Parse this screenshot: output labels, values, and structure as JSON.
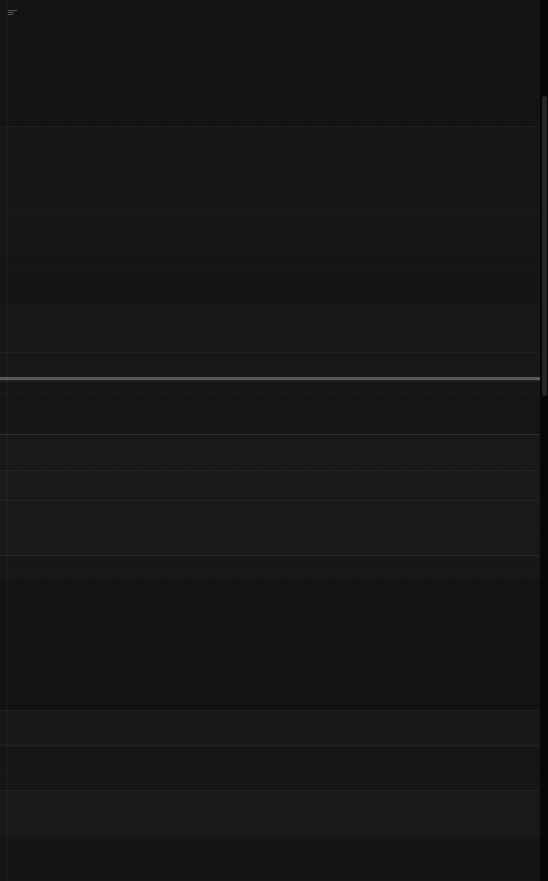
{
  "screen": {
    "width": 548,
    "height": 881,
    "appearance": "dark",
    "background_color": "#151515",
    "note": "Screenshot is near-black with extremely low contrast; no glyph or label text is resolvable at any magnification."
  },
  "palette": {
    "page_background": "#151515",
    "band_darkest": "#0d0d0d",
    "band_dark": "#131313",
    "band_mid": "#181818",
    "band_light": "#1e1e1e",
    "primary_rule": "#5a5a5a",
    "faint_rule": "#2c2c2c",
    "subtle_rule": "#222222",
    "scrollbar_track": "#060606",
    "scrollbar_thumb": "#242424",
    "icon_highlight": "#8d8d8d"
  },
  "layout": {
    "left_margin_x": 7,
    "scrollbar_width": 8,
    "scrollbar_thumb_top": 96,
    "scrollbar_thumb_height": 300
  },
  "bands": [
    {
      "name": "header-band",
      "top": 0,
      "height": 126,
      "color": "#131313"
    },
    {
      "name": "upper-content-band",
      "top": 126,
      "height": 129,
      "color": "#161616"
    },
    {
      "name": "dense-text-band",
      "top": 255,
      "height": 50,
      "color": "#141414"
    },
    {
      "name": "pre-separator-band",
      "top": 305,
      "height": 72,
      "color": "#171717"
    },
    {
      "name": "separator-highlight",
      "top": 377,
      "height": 3,
      "color": "#5a5a5a"
    },
    {
      "name": "list-band-a",
      "top": 380,
      "height": 54,
      "color": "#151515"
    },
    {
      "name": "list-band-b",
      "top": 434,
      "height": 36,
      "color": "#181818"
    },
    {
      "name": "list-band-c",
      "top": 470,
      "height": 30,
      "color": "#1a1a1a"
    },
    {
      "name": "list-band-d",
      "top": 500,
      "height": 55,
      "color": "#181818"
    },
    {
      "name": "list-band-e",
      "top": 555,
      "height": 25,
      "color": "#161616"
    },
    {
      "name": "open-band",
      "top": 580,
      "height": 130,
      "color": "#121212"
    },
    {
      "name": "list-band-f",
      "top": 710,
      "height": 35,
      "color": "#171717"
    },
    {
      "name": "list-band-g",
      "top": 745,
      "height": 45,
      "color": "#151515"
    },
    {
      "name": "list-band-h",
      "top": 790,
      "height": 45,
      "color": "#181818"
    },
    {
      "name": "footer-band",
      "top": 835,
      "height": 46,
      "color": "#141414"
    }
  ],
  "rules": [
    {
      "name": "header-divider",
      "top": 126,
      "left": 0,
      "width": 548,
      "color": "#242424",
      "opacity": 0.55
    },
    {
      "name": "row-divider-1",
      "top": 214,
      "left": 0,
      "width": 548,
      "color": "#222222",
      "opacity": 0.4
    },
    {
      "name": "row-divider-2",
      "top": 268,
      "left": 0,
      "width": 548,
      "color": "#202020",
      "opacity": 0.35
    },
    {
      "name": "row-divider-3",
      "top": 352,
      "left": 0,
      "width": 548,
      "color": "#262626",
      "opacity": 0.5
    },
    {
      "name": "row-divider-4",
      "top": 393,
      "left": 0,
      "width": 548,
      "color": "#232323",
      "opacity": 0.45
    },
    {
      "name": "row-divider-5",
      "top": 434,
      "left": 0,
      "width": 548,
      "color": "#3a3a3a",
      "opacity": 0.65
    },
    {
      "name": "row-divider-6",
      "top": 470,
      "left": 0,
      "width": 548,
      "color": "#2a2a2a",
      "opacity": 0.5
    },
    {
      "name": "row-divider-7",
      "top": 500,
      "left": 0,
      "width": 548,
      "color": "#2e2e2e",
      "opacity": 0.55
    },
    {
      "name": "row-divider-8",
      "top": 531,
      "left": 0,
      "width": 548,
      "color": "#242424",
      "opacity": 0.45
    },
    {
      "name": "row-divider-9",
      "top": 555,
      "left": 0,
      "width": 548,
      "color": "#343434",
      "opacity": 0.6
    },
    {
      "name": "row-divider-10",
      "top": 574,
      "left": 0,
      "width": 548,
      "color": "#222222",
      "opacity": 0.4
    },
    {
      "name": "row-divider-11",
      "top": 710,
      "left": 0,
      "width": 548,
      "color": "#2a2a2a",
      "opacity": 0.5
    },
    {
      "name": "row-divider-12",
      "top": 745,
      "left": 0,
      "width": 548,
      "color": "#2c2c2c",
      "opacity": 0.52
    },
    {
      "name": "row-divider-13",
      "top": 771,
      "left": 0,
      "width": 548,
      "color": "#222222",
      "opacity": 0.38
    },
    {
      "name": "row-divider-14",
      "top": 790,
      "left": 0,
      "width": 548,
      "color": "#2a2a2a",
      "opacity": 0.48
    },
    {
      "name": "row-divider-15",
      "top": 835,
      "left": 0,
      "width": 548,
      "color": "#262626",
      "opacity": 0.45
    },
    {
      "name": "row-divider-16",
      "top": 862,
      "left": 0,
      "width": 548,
      "color": "#1e1e1e",
      "opacity": 0.35
    }
  ],
  "rows": [
    {
      "name": "list-row-1",
      "top": 380,
      "height": 53
    },
    {
      "name": "list-row-2",
      "top": 435,
      "height": 34
    },
    {
      "name": "list-row-3",
      "top": 471,
      "height": 28
    },
    {
      "name": "list-row-4",
      "top": 501,
      "height": 29
    },
    {
      "name": "list-row-5",
      "top": 532,
      "height": 22
    },
    {
      "name": "list-row-6",
      "top": 711,
      "height": 33
    },
    {
      "name": "list-row-7",
      "top": 746,
      "height": 24
    },
    {
      "name": "list-row-8",
      "top": 772,
      "height": 17
    },
    {
      "name": "list-row-9",
      "top": 791,
      "height": 43
    }
  ],
  "corner_icon": {
    "name": "menu-icon",
    "left": 8,
    "top": 10
  }
}
